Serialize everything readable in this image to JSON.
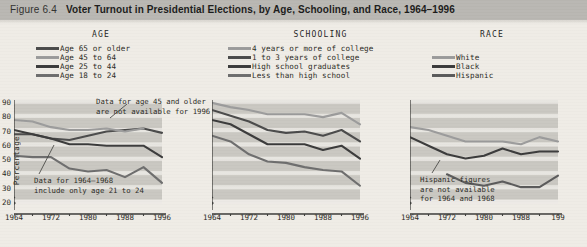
{
  "header": {
    "figure_number": "Figure 6.4",
    "title": "Voter Turnout in Presidential Elections, by Age, Schooling, and Race, 1964–1996"
  },
  "legends": [
    {
      "id": "age",
      "title": "AGE",
      "items": [
        {
          "label": "Age 65 or older",
          "color": "#4a4a4a"
        },
        {
          "label": "Age 45 to 64",
          "color": "#9b9b9b"
        },
        {
          "label": "Age 25 to 44",
          "color": "#3a3a3a"
        },
        {
          "label": "Age 18 to 24",
          "color": "#6d6d6d"
        }
      ]
    },
    {
      "id": "schooling",
      "title": "SCHOOLING",
      "items": [
        {
          "label": "4 years or more of college",
          "color": "#9b9b9b"
        },
        {
          "label": "1 to 3 years of college",
          "color": "#4a4a4a"
        },
        {
          "label": "High school graduates",
          "color": "#3a3a3a"
        },
        {
          "label": "Less than high school",
          "color": "#6d6d6d"
        }
      ]
    },
    {
      "id": "race",
      "title": "RACE",
      "items": [
        {
          "label": "White",
          "color": "#9b9b9b"
        },
        {
          "label": "Black",
          "color": "#3a3a3a"
        },
        {
          "label": "Hispanic",
          "color": "#5a5a5a"
        }
      ]
    }
  ],
  "chart_data": [
    {
      "type": "line",
      "title": "AGE",
      "xlabel": "",
      "ylabel": "Percentage",
      "x": [
        1964,
        1968,
        1972,
        1976,
        1980,
        1984,
        1988,
        1992,
        1996
      ],
      "xticks": [
        1964,
        1972,
        1980,
        1988,
        1996
      ],
      "xtick_labels": [
        "1964",
        "1972",
        "1980",
        "1988",
        "1996"
      ],
      "xlim": [
        1964,
        1996
      ],
      "ylim": [
        20,
        90
      ],
      "yticks": [
        20,
        30,
        40,
        50,
        60,
        70,
        80,
        90
      ],
      "ytick_labels": [
        "20",
        "30",
        "40",
        "50",
        "60",
        "70",
        "80",
        "90"
      ],
      "axis_break": true,
      "grid": "horizontal-bands",
      "legend_position": "above",
      "annotations": [
        {
          "text": "Data for age 45 and older\nare not available for 1996"
        },
        {
          "text": "Data for 1964–1968\ninclude only age 21 to 24"
        }
      ],
      "series": [
        {
          "name": "Age 65 or older",
          "color": "#4a4a4a",
          "values": [
            66,
            66,
            63,
            62,
            65,
            68,
            69,
            70,
            67
          ]
        },
        {
          "name": "Age 45 to 64",
          "color": "#9b9b9b",
          "values": [
            76,
            75,
            71,
            69,
            69,
            70,
            68,
            70,
            null
          ]
        },
        {
          "name": "Age 25 to 44",
          "color": "#3a3a3a",
          "values": [
            69,
            66,
            63,
            59,
            59,
            58,
            58,
            58,
            50
          ]
        },
        {
          "name": "Age 18 to 24",
          "color": "#6d6d6d",
          "values": [
            51,
            50,
            50,
            42,
            40,
            41,
            36,
            43,
            32
          ]
        }
      ]
    },
    {
      "type": "line",
      "title": "SCHOOLING",
      "xlabel": "",
      "ylabel": "",
      "x": [
        1964,
        1968,
        1972,
        1976,
        1980,
        1984,
        1988,
        1992,
        1996
      ],
      "xticks": [
        1964,
        1972,
        1980,
        1988,
        1996
      ],
      "xtick_labels": [
        "1964",
        "1972",
        "1980",
        "1988",
        "1996"
      ],
      "xlim": [
        1964,
        1996
      ],
      "ylim": [
        20,
        90
      ],
      "yticks": [
        20,
        30,
        40,
        50,
        60,
        70,
        80,
        90
      ],
      "axis_break": true,
      "grid": "horizontal-bands",
      "legend_position": "above",
      "annotations": [],
      "series": [
        {
          "name": "4 years or more of college",
          "color": "#9b9b9b",
          "values": [
            88,
            85,
            83,
            80,
            80,
            80,
            78,
            81,
            73
          ]
        },
        {
          "name": "1 to 3 years of college",
          "color": "#4a4a4a",
          "values": [
            83,
            79,
            75,
            69,
            67,
            68,
            65,
            69,
            61
          ]
        },
        {
          "name": "High school graduates",
          "color": "#3a3a3a",
          "values": [
            76,
            73,
            66,
            59,
            59,
            59,
            55,
            58,
            49
          ]
        },
        {
          "name": "Less than high school",
          "color": "#6d6d6d",
          "values": [
            65,
            61,
            52,
            47,
            46,
            43,
            41,
            40,
            30
          ]
        }
      ]
    },
    {
      "type": "line",
      "title": "RACE",
      "xlabel": "",
      "ylabel": "",
      "x": [
        1964,
        1968,
        1972,
        1976,
        1980,
        1984,
        1988,
        1992,
        1996
      ],
      "xticks": [
        1964,
        1972,
        1980,
        1988,
        1996
      ],
      "xtick_labels": [
        "1964",
        "1972",
        "1980",
        "1988",
        "199"
      ],
      "xlim": [
        1964,
        1996
      ],
      "ylim": [
        20,
        90
      ],
      "yticks": [
        20,
        30,
        40,
        50,
        60,
        70,
        80,
        90
      ],
      "axis_break": true,
      "grid": "horizontal-bands",
      "legend_position": "above",
      "annotations": [
        {
          "text": "Hispanic figures\nare not available\nfor 1964 and 1968"
        }
      ],
      "series": [
        {
          "name": "White",
          "color": "#9b9b9b",
          "values": [
            71,
            69,
            65,
            61,
            61,
            61,
            59,
            64,
            61
          ]
        },
        {
          "name": "Black",
          "color": "#3a3a3a",
          "values": [
            64,
            58,
            52,
            49,
            51,
            56,
            52,
            54,
            54
          ]
        },
        {
          "name": "Hispanic",
          "color": "#5a5a5a",
          "values": [
            null,
            null,
            38,
            32,
            30,
            33,
            29,
            29,
            37
          ]
        }
      ]
    }
  ]
}
